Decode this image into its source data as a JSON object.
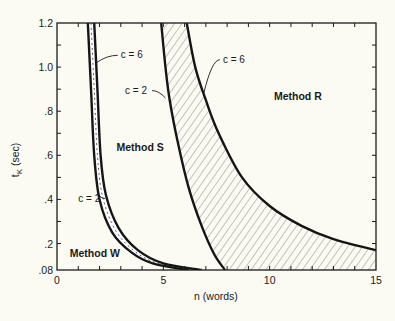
{
  "chart_data": {
    "type": "line",
    "title": "",
    "xlabel": "n (words)",
    "ylabel": "t_K (sec)",
    "xlim": [
      0,
      15
    ],
    "ylim": [
      0.08,
      1.2
    ],
    "x_ticks": [
      0,
      5,
      10,
      15
    ],
    "x_tick_labels": [
      "0",
      "5",
      "10",
      "15"
    ],
    "y_ticks": [
      0.08,
      0.2,
      0.4,
      0.6,
      0.8,
      1.0,
      1.2
    ],
    "y_tick_labels": [
      ".08",
      ".2",
      ".4",
      ".6",
      ".8",
      "1.0",
      "1.2"
    ],
    "grid": false,
    "legend": null,
    "series": [
      {
        "name": "W/S boundary c = 2",
        "boundary": "W-S",
        "c": 2,
        "points": [
          [
            1.45,
            1.2
          ],
          [
            1.6,
            0.9
          ],
          [
            1.75,
            0.6
          ],
          [
            2.0,
            0.4
          ],
          [
            2.6,
            0.25
          ],
          [
            3.5,
            0.16
          ],
          [
            4.5,
            0.11
          ],
          [
            6.2,
            0.08
          ]
        ]
      },
      {
        "name": "W/S boundary c = 6",
        "boundary": "W-S",
        "c": 6,
        "points": [
          [
            1.75,
            1.2
          ],
          [
            1.9,
            0.9
          ],
          [
            2.05,
            0.6
          ],
          [
            2.3,
            0.42
          ],
          [
            2.9,
            0.27
          ],
          [
            3.8,
            0.17
          ],
          [
            5.0,
            0.11
          ],
          [
            6.8,
            0.08
          ]
        ]
      },
      {
        "name": "S/R boundary c = 2",
        "boundary": "S-R",
        "c": 2,
        "points": [
          [
            4.9,
            1.2
          ],
          [
            5.1,
            1.0
          ],
          [
            5.3,
            0.85
          ],
          [
            5.7,
            0.65
          ],
          [
            6.2,
            0.45
          ],
          [
            6.8,
            0.28
          ],
          [
            7.4,
            0.15
          ],
          [
            7.9,
            0.08
          ]
        ]
      },
      {
        "name": "S/R boundary c = 6",
        "boundary": "S-R",
        "c": 6,
        "points": [
          [
            6.1,
            1.2
          ],
          [
            6.5,
            1.0
          ],
          [
            7.0,
            0.85
          ],
          [
            7.6,
            0.7
          ],
          [
            8.7,
            0.5
          ],
          [
            10.0,
            0.37
          ],
          [
            11.5,
            0.28
          ],
          [
            13.0,
            0.22
          ],
          [
            15.0,
            0.17
          ]
        ]
      }
    ],
    "regions": [
      {
        "label": "Method W",
        "x": 0.6,
        "y": 0.14
      },
      {
        "label": "Method S",
        "x": 2.8,
        "y": 0.62
      },
      {
        "label": "Method R",
        "x": 10.2,
        "y": 0.85
      }
    ],
    "annotations": [
      {
        "text": "c = 6",
        "x": 3.0,
        "y": 1.04,
        "target": "W/S boundary c = 6"
      },
      {
        "text": "c = 2",
        "x": 1.0,
        "y": 0.39,
        "target": "W/S boundary c = 2"
      },
      {
        "text": "c = 2",
        "x": 3.2,
        "y": 0.88,
        "target": "S/R boundary c = 2"
      },
      {
        "text": "c = 6",
        "x": 7.8,
        "y": 1.02,
        "target": "S/R boundary c = 6"
      }
    ],
    "shading": "hatched band between c = 2 and c = 6 curves"
  }
}
